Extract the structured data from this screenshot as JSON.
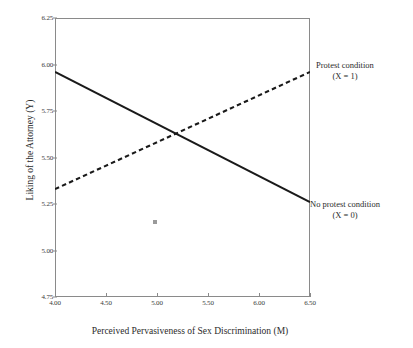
{
  "chart_data": {
    "type": "line",
    "title": "",
    "xlabel": "Perceived Pervasiveness of Sex Discrimination (M)",
    "ylabel": "Liking of the Attorney (Y)",
    "xlim": [
      4.0,
      6.5
    ],
    "ylim": [
      4.75,
      6.25
    ],
    "xticks": [
      "4.00",
      "4.50",
      "5.00",
      "5.50",
      "6.00",
      "6.50"
    ],
    "xtick_values": [
      4.0,
      4.5,
      5.0,
      5.5,
      6.0,
      6.5
    ],
    "yticks": [
      "4.75",
      "5.00",
      "5.25",
      "5.50",
      "5.75",
      "6.00",
      "6.25"
    ],
    "ytick_values": [
      4.75,
      5.0,
      5.25,
      5.5,
      5.75,
      6.0,
      6.25
    ],
    "grid": false,
    "legend_position": "right-inline-annotations",
    "series": [
      {
        "name": "No protest condition (X = 0)",
        "style": "solid",
        "color": "#1a1a1a",
        "x": [
          4.0,
          6.5
        ],
        "values": [
          5.96,
          5.26
        ]
      },
      {
        "name": "Protest condition (X = 1)",
        "style": "dashed",
        "color": "#1a1a1a",
        "x": [
          4.0,
          6.5
        ],
        "values": [
          5.33,
          5.96
        ]
      }
    ],
    "annotations": [
      {
        "id": "protest",
        "line1": "Protest condition",
        "line2": "(X = 1)"
      },
      {
        "id": "noprotest",
        "line1": "No protest condition",
        "line2": "(X = 0)"
      }
    ],
    "intersection": {
      "x": 5.2,
      "y": 5.63
    }
  }
}
